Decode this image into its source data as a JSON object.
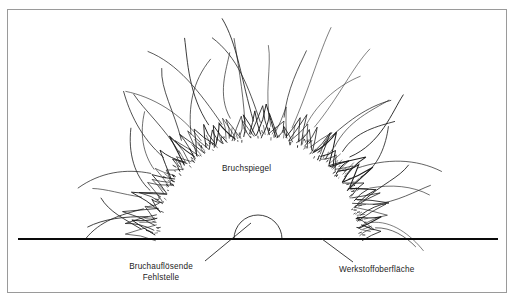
{
  "figure": {
    "type": "fractography-schematic",
    "title_visible": false,
    "background_color": "#ffffff",
    "border_color": "#9a9a9a",
    "ink_color": "#1c1c1c"
  },
  "labels": {
    "mirror": "Bruchspiegel",
    "flaw_line1": "Bruchauflösende",
    "flaw_line2": "Fehlstelle",
    "surface": "Werkstoffoberfläche"
  },
  "geometry": {
    "origin_x": 258,
    "origin_y": 239,
    "baseline_y": 239,
    "baseline_x_start": 18,
    "baseline_x_end": 498,
    "baseline_width": 2.1,
    "mirror_radius": 100,
    "hackle_inner_radius": 101,
    "hackle_outer_radius": 128,
    "crack_min_radius": 126,
    "crack_max_radius": 215,
    "flaw_radius": 24,
    "stipple_count": 150,
    "hackle_count": 62,
    "crack_count": 34,
    "angle_start_deg": 2,
    "angle_end_deg": 178
  },
  "leaders": {
    "flaw": {
      "x1": 205,
      "y1": 261,
      "x2": 251,
      "y2": 223
    },
    "surface": {
      "x1": 322,
      "y1": 239,
      "x2": 353,
      "y2": 262
    }
  },
  "chart_data": {
    "type": "diagram",
    "regions": [
      {
        "name": "Bruchspiegel",
        "shape": "semicircle",
        "radius": 100
      },
      {
        "name": "Bruchauflösende Fehlstelle",
        "shape": "semicircle",
        "radius": 24
      },
      {
        "name": "Werkstoffoberfläche",
        "shape": "horizontal-line"
      }
    ]
  }
}
